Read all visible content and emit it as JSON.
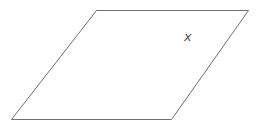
{
  "diagram": {
    "shape": "parallelogram",
    "vertices": [
      [
        96,
        10
      ],
      [
        248,
        10
      ],
      [
        171,
        119
      ],
      [
        11,
        119
      ]
    ],
    "stroke_color": "#707070",
    "label": {
      "text": "x",
      "x": 188,
      "y": 41,
      "color": "#555555"
    }
  }
}
